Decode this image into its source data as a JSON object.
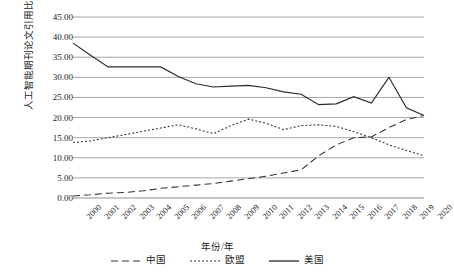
{
  "chart_data": {
    "type": "line",
    "title": "",
    "xlabel": "年份/年",
    "ylabel": "人工智能期刊论文引用比例/%",
    "x": [
      2000,
      2001,
      2002,
      2003,
      2004,
      2005,
      2006,
      2007,
      2008,
      2009,
      2010,
      2011,
      2012,
      2013,
      2014,
      2015,
      2016,
      2017,
      2018,
      2019,
      2020
    ],
    "categories": [
      "2000",
      "2001",
      "2002",
      "2003",
      "2004",
      "2005",
      "2006",
      "2007",
      "2008",
      "2009",
      "2010",
      "2011",
      "2012",
      "2013",
      "2014",
      "2015",
      "2016",
      "2017",
      "2018",
      "2019",
      "2020"
    ],
    "ylim": [
      0,
      45
    ],
    "ytick_step": 5,
    "ytick_labels": [
      "0.00",
      "5.00",
      "10.00",
      "15.00",
      "20.00",
      "25.00",
      "30.00",
      "35.00",
      "40.00",
      "45.00"
    ],
    "grid": true,
    "legend_position": "bottom",
    "series": [
      {
        "name": "中国",
        "style": "dashed",
        "color": "#333333",
        "values": [
          0.5,
          0.8,
          1.2,
          1.4,
          1.8,
          2.4,
          2.8,
          3.2,
          3.6,
          4.2,
          4.8,
          5.4,
          6.2,
          7.0,
          10.5,
          13.2,
          15.0,
          15.2,
          17.5,
          19.5,
          20.5
        ]
      },
      {
        "name": "欧盟",
        "style": "dotted",
        "color": "#333333",
        "values": [
          13.8,
          14.2,
          15.0,
          15.8,
          16.6,
          17.4,
          18.2,
          17.2,
          16.0,
          18.0,
          19.6,
          18.6,
          17.0,
          18.0,
          18.2,
          17.8,
          16.5,
          15.0,
          13.2,
          11.8,
          10.5
        ]
      },
      {
        "name": "美国",
        "style": "solid",
        "color": "#2b2b2b",
        "values": [
          38.5,
          35.5,
          32.6,
          32.6,
          32.6,
          32.6,
          30.2,
          28.4,
          27.6,
          27.8,
          28.0,
          27.4,
          26.4,
          25.8,
          23.2,
          23.4,
          25.2,
          23.6,
          30.0,
          22.4,
          20.5
        ]
      }
    ]
  },
  "axes": {
    "plot_left": 73,
    "plot_right": 424,
    "plot_top": 17,
    "plot_bottom": 198
  }
}
